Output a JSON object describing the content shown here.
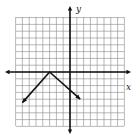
{
  "chart_data": {
    "type": "line",
    "title": "",
    "xlabel": "x",
    "ylabel": "y",
    "grid": true,
    "xlim": [
      -8,
      8
    ],
    "ylim": [
      -8,
      8
    ],
    "series": [
      {
        "name": "y = -|x + 3|",
        "x": [
          -7,
          -3,
          1.5
        ],
        "y": [
          -4.5,
          0,
          -4
        ],
        "arrows": "both-ends"
      }
    ],
    "vertex": [
      -3,
      0
    ]
  },
  "labels": {
    "x_axis": "x",
    "y_axis": "y"
  }
}
